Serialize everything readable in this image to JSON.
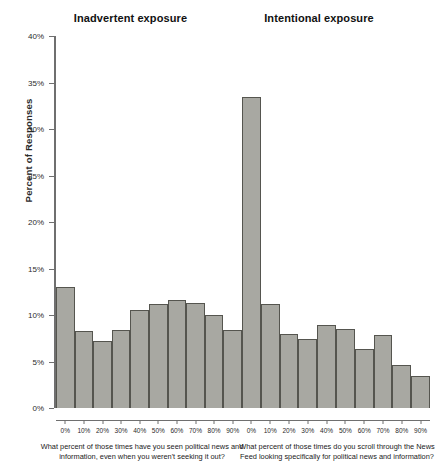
{
  "figure": {
    "y_axis_label": "Percent of Responses",
    "bar_fill_color": "#a8a8a2",
    "bar_border_color": "#55554f",
    "axis_color": "#6f6f6f"
  },
  "panels": [
    {
      "title": "Inadvertent exposure",
      "caption": "What percent of those times have you seen political news and information, even when you weren't seeking it out?"
    },
    {
      "title": "Intentional exposure",
      "caption": "What percent of those times do you scroll through the News Feed looking specifically for political news and information?"
    }
  ],
  "y_ticks": [
    "0%",
    "5%",
    "10%",
    "15%",
    "20%",
    "25%",
    "30%",
    "35%",
    "40%"
  ],
  "x_ticks": [
    "0%",
    "10%",
    "20%",
    "30%",
    "40%",
    "50%",
    "60%",
    "70%",
    "80%",
    "90%"
  ],
  "chart_data": [
    {
      "type": "bar",
      "title": "Inadvertent exposure",
      "subtitle": "What percent of those times have you seen political news and information, even when you weren't seeking it out?",
      "xlabel": "",
      "ylabel": "Percent of Responses",
      "categories": [
        "0%",
        "10%",
        "20%",
        "30%",
        "40%",
        "50%",
        "60%",
        "70%",
        "80%",
        "90%"
      ],
      "values": [
        13.0,
        8.3,
        7.2,
        8.4,
        10.5,
        11.2,
        11.6,
        11.3,
        10.0,
        8.4
      ],
      "ylim": [
        0,
        40
      ],
      "ytick_step": 5,
      "grid": false,
      "legend": "none"
    },
    {
      "type": "bar",
      "title": "Intentional exposure",
      "subtitle": "What percent of those times do you scroll through the News Feed looking specifically for political news and information?",
      "xlabel": "",
      "ylabel": "Percent of Responses",
      "categories": [
        "0%",
        "10%",
        "20%",
        "30%",
        "40%",
        "50%",
        "60%",
        "70%",
        "80%",
        "90%"
      ],
      "values": [
        33.4,
        11.2,
        8.0,
        7.4,
        8.9,
        8.5,
        6.3,
        7.9,
        4.6,
        3.4
      ],
      "ylim": [
        0,
        40
      ],
      "ytick_step": 5,
      "grid": false,
      "legend": "none"
    }
  ]
}
